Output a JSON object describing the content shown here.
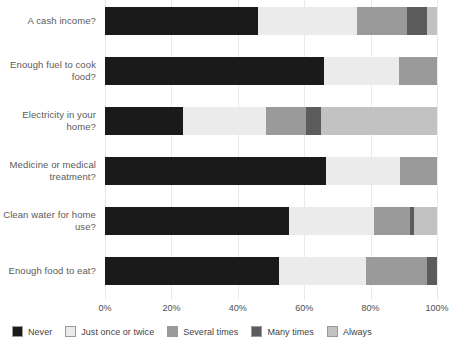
{
  "chart_data": {
    "type": "bar",
    "orientation": "horizontal",
    "stacked": true,
    "normalized": true,
    "title": "",
    "subtitle": "",
    "xlabel": "",
    "ylabel": "",
    "xlim": [
      0,
      100
    ],
    "xunit": "%",
    "grid": true,
    "legend_position": "bottom",
    "xticks": [
      "0%",
      "20%",
      "40%",
      "60%",
      "80%",
      "100%"
    ],
    "xtick_values": [
      0,
      20,
      40,
      60,
      80,
      100
    ],
    "categories": [
      "A cash income?",
      "Enough fuel to cook food?",
      "Electricity in your home?",
      "Medicine or medical treatment?",
      "Clean water for home use?",
      "Enough food to eat?"
    ],
    "series": [
      {
        "name": "Never",
        "color": "#1a1a1a",
        "values": [
          46.0,
          66.0,
          23.5,
          66.5,
          55.5,
          52.5
        ]
      },
      {
        "name": "Just once or twice",
        "color": "#ebebeb",
        "values": [
          30.0,
          22.5,
          25.0,
          22.5,
          25.5,
          26.0
        ]
      },
      {
        "name": "Several times",
        "color": "#9a9a9a",
        "values": [
          15.0,
          11.5,
          12.0,
          11.0,
          11.0,
          18.5
        ]
      },
      {
        "name": "Many times",
        "color": "#5c5c5c",
        "values": [
          6.0,
          0.0,
          4.5,
          0.0,
          1.0,
          3.0
        ]
      },
      {
        "name": "Always",
        "color": "#c2c2c2",
        "values": [
          3.0,
          0.0,
          35.0,
          0.0,
          7.0,
          0.0
        ]
      }
    ]
  },
  "legend": {
    "items": [
      {
        "label": "Never",
        "color": "#1a1a1a"
      },
      {
        "label": "Just once or twice",
        "color": "#ebebeb"
      },
      {
        "label": "Several times",
        "color": "#9a9a9a"
      },
      {
        "label": "Many times",
        "color": "#5c5c5c"
      },
      {
        "label": "Always",
        "color": "#c2c2c2"
      }
    ]
  },
  "colors": {
    "background": "#ffffff",
    "grid": "#e9e9e9",
    "text": "#4d4d4d"
  }
}
